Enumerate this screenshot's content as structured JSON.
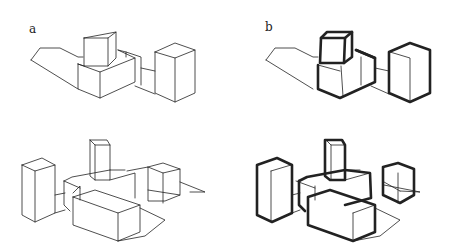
{
  "panels": [
    {
      "id": "a",
      "label": "a",
      "label_pos": [
        29,
        30
      ]
    },
    {
      "id": "b",
      "label": "b",
      "label_pos": [
        265,
        28
      ]
    }
  ],
  "colors": {
    "line": "#222222",
    "bg": "#ffffff"
  },
  "thin_width": 0.8,
  "bold_width": 2.6,
  "drawings": {
    "a_top": {
      "thin": [
        "31,60 40,48 60,48 78,57 83,57",
        "31,60 78,89",
        "84,38 116,32",
        "84,38 84,66 108,66 116,58 116,32 108,38 84,38",
        "108,38 108,66",
        "78,64 84,66",
        "78,64 78,89 100,98 135,82 135,58 118,50",
        "78,64 100,72 135,58",
        "100,72 100,98",
        "118,50 126,52 141,57 141,85",
        "126,52 126,57",
        "141,68 155,71",
        "135,86 155,94",
        "155,52 175,43 195,50 195,93 175,102 155,93 155,52",
        "155,52 175,58 195,50",
        "175,58 175,102"
      ],
      "bold": []
    },
    "b_top": {
      "thin": [
        "266,60 275,48 295,48 313,57 318,57",
        "266,60 313,89",
        "341,66 343,96",
        "318,65 340,71",
        "361,57 361,85",
        "375,68 389,71",
        "371,86 389,94",
        "390,52 410,58 410,102"
      ],
      "bold": [
        "321,38 327,32 352,32 352,57 344,63 320,63 321,38",
        "321,38 345,38 352,32",
        "345,38 344,63",
        "318,65 318,89 340,98 375,82 375,58 356,50",
        "356,50 375,58",
        "389,52 410,43 430,50 430,93 410,102 389,93 389,52"
      ]
    },
    "a_bottom": {
      "thin": [
        "22,165 42,158 55,165 55,213 35,222 22,215 22,165",
        "22,165 35,171 55,165",
        "35,171 35,222",
        "55,195 65,193",
        "55,213 65,210",
        "90,140 107,140 110,145 110,180 95,180 90,176 90,140",
        "90,140 95,145 110,145",
        "95,145 95,180",
        "110,180 135,173 135,198",
        "64,181 64,205 70,211",
        "64,181 72,177 110,170",
        "64,181 80,188",
        "73,193 80,186 80,200",
        "110,170 125,170",
        "127,171 148,167 148,201 165,201 180,195 148,190",
        "148,167 163,163 180,169 180,195",
        "148,167 163,173 180,169",
        "163,173 163,203",
        "180,182 205,192 190,192",
        "73,197 73,225 118,241 140,232 140,205 95,190 73,197",
        "73,197 118,213 140,205",
        "118,213 118,241",
        "118,241 145,236 165,220 140,208"
      ],
      "bold": []
    },
    "b_bottom": {
      "thin": [
        "271,171 271,220",
        "291,165 271,171",
        "292,195 300,193",
        "292,213 300,210",
        "331,145 331,180",
        "326,140 331,145 345,145",
        "345,180 370,173",
        "296,181 315,188",
        "315,186 315,200",
        "345,170 360,170",
        "384,182 400,191",
        "400,191 420,192 384,185",
        "353,213 375,205",
        "353,213 353,241",
        "353,241 380,236 400,220 375,208",
        "398,173 398,203"
      ],
      "bold": [
        "257,165 277,158 292,165 292,213 272,222 257,215 257,165",
        "325,140 342,140 345,145 345,180 330,180 325,176 325,140",
        "299,181 307,177 345,170",
        "299,181 299,205 305,211",
        "345,170 370,173 371,198 345,205",
        "383,167 398,163 414,169 414,195 400,203 383,195 383,167",
        "308,197 308,225 353,241 375,232 375,205 330,190 308,197"
      ]
    }
  }
}
